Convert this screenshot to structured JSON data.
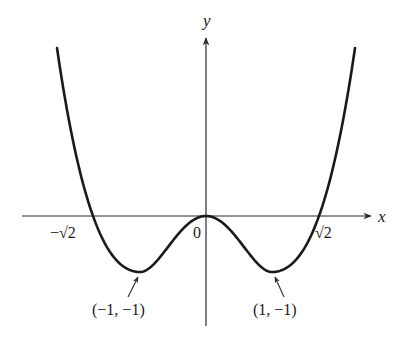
{
  "chart_data": {
    "type": "line",
    "title": "",
    "function": "y = x^4 - 2x^2",
    "xlabel": "x",
    "ylabel": "y",
    "grid": false,
    "legend": null,
    "x_ticks": [
      {
        "value": -1.4142,
        "label": "−√2"
      },
      {
        "value": 0,
        "label": "0"
      },
      {
        "value": 1.4142,
        "label": "√2"
      }
    ],
    "annotations": [
      {
        "point": [
          -1,
          -1
        ],
        "text": "(−1, −1)",
        "kind": "local minimum"
      },
      {
        "point": [
          1,
          -1
        ],
        "text": "(1, −1)",
        "kind": "local minimum"
      },
      {
        "point": [
          0,
          0
        ],
        "text": "0",
        "kind": "local maximum / origin"
      }
    ],
    "key_points": {
      "x": [
        -1.732,
        -1.4142,
        -1,
        0,
        1,
        1.4142,
        1.732
      ],
      "y": [
        3,
        0,
        -1,
        0,
        -1,
        0,
        3
      ]
    },
    "xlim": [
      -1.8,
      1.8
    ],
    "ylim": [
      -1.9,
      3.2
    ]
  },
  "labels": {
    "x_axis": "x",
    "y_axis": "y",
    "origin": "0",
    "neg_root": "−√2",
    "pos_root": "√2",
    "left_min": "(−1, −1)",
    "right_min": "(1, −1)"
  },
  "colors": {
    "curve": "#1a1a1a",
    "axis": "#2a2a2a",
    "background": "#ffffff"
  }
}
